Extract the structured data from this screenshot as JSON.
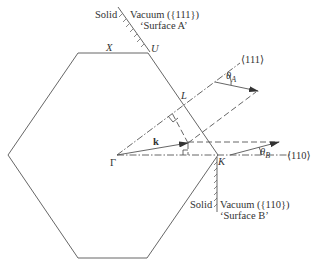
{
  "diagram": {
    "points": {
      "gamma": "Γ",
      "x": "X",
      "u": "U",
      "l": "L",
      "k_point": "K",
      "k_vector": "k"
    },
    "surface_a": {
      "solid": "Solid",
      "vacuum": "Vacuum ({111})",
      "name": "‘Surface A’"
    },
    "surface_b": {
      "solid": "Solid",
      "vacuum": "Vacuum ({110})",
      "name": "‘Surface B’"
    },
    "directions": {
      "d111": "⟨111⟩",
      "d110": "⟨110⟩"
    },
    "angles": {
      "theta_a": "θ",
      "theta_a_sub": "A",
      "theta_b": "θ",
      "theta_b_sub": "B"
    }
  }
}
